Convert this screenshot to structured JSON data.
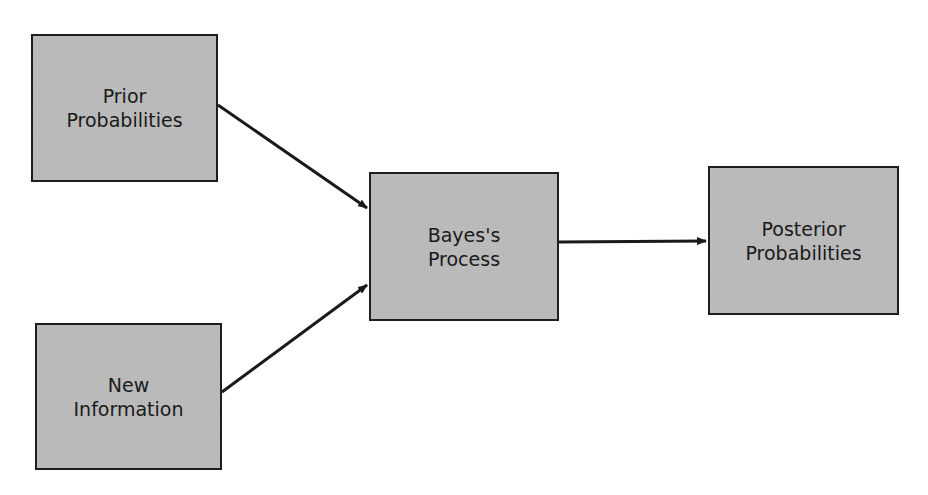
{
  "diagram": {
    "nodes": {
      "prior": {
        "line1": "Prior",
        "line2": "Probabilities"
      },
      "new_information": {
        "line1": "New",
        "line2": "Information"
      },
      "bayes_process": {
        "line1": "Bayes's",
        "line2": "Process"
      },
      "posterior": {
        "line1": "Posterior",
        "line2": "Probabilities"
      }
    },
    "edges": [
      {
        "from": "prior",
        "to": "bayes_process"
      },
      {
        "from": "new_information",
        "to": "bayes_process"
      },
      {
        "from": "bayes_process",
        "to": "posterior"
      }
    ],
    "colors": {
      "box_fill": "#b9b9b9",
      "box_border": "#1e1e1e",
      "arrow": "#1a1a1a"
    }
  }
}
